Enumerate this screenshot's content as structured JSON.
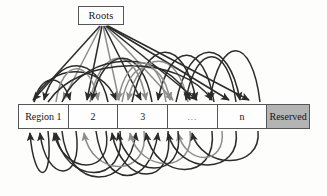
{
  "figure": {
    "type": "node-link-diagram",
    "background_color": "#fdfdfc",
    "line_color_dark": "#2b2b2b",
    "line_color_light": "#8d8d8d",
    "border_color": "#56565a"
  },
  "roots": {
    "label": "Roots",
    "x": 78,
    "y": 6,
    "width": 46,
    "height": 19
  },
  "region_bar": {
    "x": 18,
    "y": 104,
    "width": 292,
    "height": 25,
    "cells": [
      {
        "label": "Region 1",
        "width": 50,
        "shaded": false,
        "kind": "region"
      },
      {
        "label": "2",
        "width": 50,
        "shaded": false,
        "kind": "region"
      },
      {
        "label": "3",
        "width": 50,
        "shaded": false,
        "kind": "region"
      },
      {
        "label": "...",
        "width": 50,
        "shaded": false,
        "kind": "ellipsis"
      },
      {
        "label": "n",
        "width": 50,
        "shaded": false,
        "kind": "region"
      },
      {
        "label": "Reserved",
        "width": 42,
        "shaded": true,
        "kind": "reserved"
      }
    ],
    "reserved_fill": "#b4b4b4"
  },
  "edges": {
    "root_edges_note": "straight lines fanning from Roots box down to region cells",
    "upper_arc_note": "curved arcs above the bar between regions",
    "lower_arc_note": "curved arcs below the bar between regions",
    "root_targets_x": [
      32,
      62,
      86,
      118,
      140,
      172,
      196,
      228,
      248
    ],
    "upper_arcs": [
      {
        "from": 34,
        "to": 70,
        "peak": 78,
        "shade": "dark"
      },
      {
        "from": 34,
        "to": 116,
        "peak": 70,
        "shade": "dark"
      },
      {
        "from": 56,
        "to": 98,
        "peak": 62,
        "shade": "light"
      },
      {
        "from": 90,
        "to": 146,
        "peak": 52,
        "shade": "light"
      },
      {
        "from": 108,
        "to": 44,
        "peak": 58,
        "shade": "dark"
      },
      {
        "from": 132,
        "to": 196,
        "peak": 44,
        "shade": "dark"
      },
      {
        "from": 152,
        "to": 92,
        "peak": 50,
        "shade": "dark"
      },
      {
        "from": 176,
        "to": 240,
        "peak": 46,
        "shade": "dark"
      },
      {
        "from": 188,
        "to": 128,
        "peak": 56,
        "shade": "light"
      },
      {
        "from": 214,
        "to": 158,
        "peak": 48,
        "shade": "dark"
      },
      {
        "from": 236,
        "to": 186,
        "peak": 50,
        "shade": "dark"
      },
      {
        "from": 260,
        "to": 210,
        "peak": 44,
        "shade": "dark"
      }
    ],
    "lower_arcs": [
      {
        "from": 48,
        "to": 30,
        "dip": 185,
        "shade": "dark"
      },
      {
        "from": 62,
        "to": 136,
        "dip": 178,
        "shade": "dark"
      },
      {
        "from": 76,
        "to": 40,
        "dip": 172,
        "shade": "dark"
      },
      {
        "from": 96,
        "to": 158,
        "dip": 180,
        "shade": "dark"
      },
      {
        "from": 120,
        "to": 56,
        "dip": 176,
        "shade": "dark"
      },
      {
        "from": 144,
        "to": 84,
        "dip": 170,
        "shade": "light"
      },
      {
        "from": 168,
        "to": 112,
        "dip": 182,
        "shade": "dark"
      },
      {
        "from": 190,
        "to": 130,
        "dip": 168,
        "shade": "light"
      },
      {
        "from": 212,
        "to": 146,
        "dip": 176,
        "shade": "dark"
      },
      {
        "from": 236,
        "to": 168,
        "dip": 170,
        "shade": "dark"
      },
      {
        "from": 258,
        "to": 192,
        "dip": 164,
        "shade": "dark"
      }
    ]
  }
}
